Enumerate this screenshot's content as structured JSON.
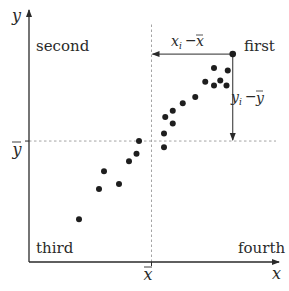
{
  "diagram": {
    "type": "scatter-quadrants",
    "colors": {
      "ink": "#2a2a2a",
      "dashed": "#9a9a9a",
      "point": "#1e1e1e"
    },
    "axes": {
      "x_label": "x",
      "y_label": "y",
      "x_mean_label": "x",
      "y_mean_label": "y"
    },
    "quadrants": {
      "first": "first",
      "second": "second",
      "third": "third",
      "fourth": "fourth"
    },
    "annotations": {
      "x_deviation": {
        "var": "x",
        "sub": "i",
        "op": "−",
        "mean": "x"
      },
      "y_deviation": {
        "var": "y",
        "sub": "i",
        "op": "−",
        "mean": "y"
      }
    },
    "points": [
      {
        "x": 0.2,
        "y": 0.17
      },
      {
        "x": 0.28,
        "y": 0.29
      },
      {
        "x": 0.3,
        "y": 0.36
      },
      {
        "x": 0.36,
        "y": 0.31
      },
      {
        "x": 0.4,
        "y": 0.4
      },
      {
        "x": 0.43,
        "y": 0.43
      },
      {
        "x": 0.44,
        "y": 0.48
      },
      {
        "x": 0.54,
        "y": 0.455
      },
      {
        "x": 0.54,
        "y": 0.51
      },
      {
        "x": 0.545,
        "y": 0.575
      },
      {
        "x": 0.575,
        "y": 0.55
      },
      {
        "x": 0.575,
        "y": 0.6
      },
      {
        "x": 0.615,
        "y": 0.63
      },
      {
        "x": 0.665,
        "y": 0.655
      },
      {
        "x": 0.705,
        "y": 0.715
      },
      {
        "x": 0.74,
        "y": 0.7
      },
      {
        "x": 0.74,
        "y": 0.77
      },
      {
        "x": 0.765,
        "y": 0.72
      },
      {
        "x": 0.79,
        "y": 0.7
      },
      {
        "x": 0.795,
        "y": 0.76
      }
    ],
    "highlight_point": {
      "x": 0.815,
      "y": 0.825
    },
    "mean": {
      "x": 0.49,
      "y": 0.48
    }
  }
}
